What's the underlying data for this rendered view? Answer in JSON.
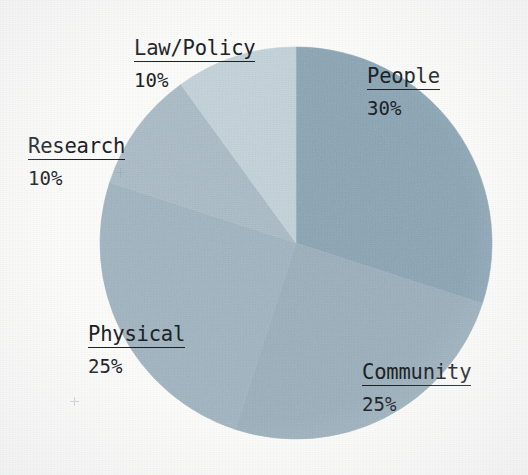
{
  "chart_data": {
    "type": "pie",
    "title": "",
    "subtitle": "",
    "xlabel": "",
    "ylabel": "",
    "legend_position": "none",
    "grid": false,
    "label_format": "name + percent",
    "start_angle_deg": 0,
    "direction": "clockwise",
    "categories": [
      "People",
      "Community",
      "Physical",
      "Research",
      "Law/Policy"
    ],
    "values": [
      30,
      25,
      25,
      10,
      10
    ],
    "percent_labels": [
      "30%",
      "25%",
      "25%",
      "10%",
      "10%"
    ],
    "total": 100,
    "slices": [
      {
        "label": "People",
        "value": 30,
        "percent": "30%",
        "color": "#8ba6b6",
        "start_deg": 0,
        "end_deg": 108
      },
      {
        "label": "Community",
        "value": 25,
        "percent": "25%",
        "color": "#9bb1be",
        "start_deg": 108,
        "end_deg": 198
      },
      {
        "label": "Physical",
        "value": 25,
        "percent": "25%",
        "color": "#a1b6c2",
        "start_deg": 198,
        "end_deg": 288
      },
      {
        "label": "Research",
        "value": 10,
        "percent": "10%",
        "color": "#acbdc8",
        "start_deg": 288,
        "end_deg": 324
      },
      {
        "label": "Law/Policy",
        "value": 10,
        "percent": "10%",
        "color": "#c5d4dc",
        "start_deg": 324,
        "end_deg": 360
      }
    ],
    "geometry": {
      "center_x": 296,
      "center_y": 243,
      "radius": 196
    }
  },
  "labels": {
    "people": {
      "name": "People",
      "percent": "30%"
    },
    "community": {
      "name": "Community",
      "percent": "25%"
    },
    "physical": {
      "name": "Physical",
      "percent": "25%"
    },
    "research": {
      "name": "Research",
      "percent": "10%"
    },
    "law_policy": {
      "name": "Law/Policy",
      "percent": "10%"
    }
  },
  "colors": {
    "background": "#fbfbfa",
    "text": "#1c2226",
    "people": "#8ba6b6",
    "community": "#9bb1be",
    "physical": "#a1b6c2",
    "research": "#acbdc8",
    "law_policy": "#c5d4dc",
    "registration_mark": "#9aa7ad"
  }
}
